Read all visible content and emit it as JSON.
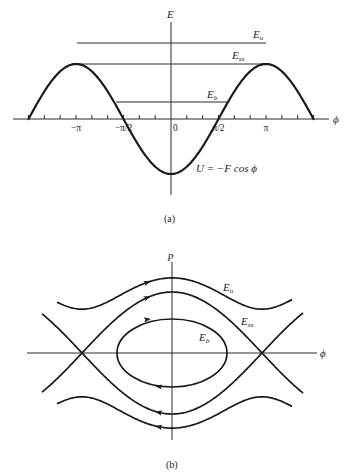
{
  "panel_a": {
    "caption": "(a)",
    "y_axis_label": "E",
    "x_axis_label": "ϕ",
    "curve_label": "U = −F cos ϕ",
    "tick_labels": [
      {
        "text": "−π",
        "phi": -3.14159
      },
      {
        "text": "−π/2",
        "phi": -1.5708
      },
      {
        "text": "0",
        "phi": 0
      },
      {
        "text": "π/2",
        "phi": 1.5708
      },
      {
        "text": "π",
        "phi": 3.14159
      }
    ],
    "levels": [
      {
        "name": "E",
        "sub": "u"
      },
      {
        "name": "E",
        "sub": "sx"
      },
      {
        "name": "E",
        "sub": "b"
      }
    ]
  },
  "panel_b": {
    "caption": "(b)",
    "y_axis_label": "p",
    "x_axis_label": "ϕ",
    "orbit_labels": [
      {
        "name": "E",
        "sub": "u"
      },
      {
        "name": "E",
        "sub": "sx"
      },
      {
        "name": "E",
        "sub": "b"
      }
    ]
  },
  "chart_data": [
    {
      "type": "line",
      "title": "(a) Potential energy U = −F cos ϕ",
      "xlabel": "ϕ",
      "ylabel": "E",
      "x_range": [
        -4.712,
        4.712
      ],
      "x_ticks_step": "π/6",
      "tick_labels": [
        "−π",
        "−π/2",
        "0",
        "π/2",
        "π"
      ],
      "series": [
        {
          "name": "U = −F cos ϕ",
          "function": "-cos(phi)",
          "F": 1
        }
      ],
      "energy_levels": [
        {
          "name": "E_u",
          "value": 1.38,
          "x_range": [
            -3.14,
            3.14
          ]
        },
        {
          "name": "E_sx",
          "value": 1.0,
          "x_range": [
            -3.14,
            3.14
          ]
        },
        {
          "name": "E_b",
          "value": 0.31,
          "x_range": [
            -1.89,
            1.89
          ]
        }
      ]
    },
    {
      "type": "line",
      "title": "(b) Phase portrait",
      "xlabel": "ϕ",
      "ylabel": "p",
      "series": [
        {
          "name": "E_u",
          "kind": "unbound",
          "direction": "upper: right, lower: left"
        },
        {
          "name": "E_sx",
          "kind": "separatrix",
          "saddle_points_phi": [
            -3.14159,
            3.14159
          ]
        },
        {
          "name": "E_b",
          "kind": "bound closed orbit",
          "direction": "clockwise"
        }
      ]
    }
  ]
}
